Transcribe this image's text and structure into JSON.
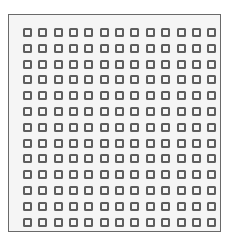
{
  "grid": {
    "rows": 13,
    "cols": 13,
    "origin_x": 14,
    "origin_y": 13,
    "pitch_x": 15.35,
    "pitch_y": 15.8,
    "cell_color": "#5e5e5e",
    "frame_border_color": "#6a6a6a",
    "frame_background": "#f5f5f5"
  }
}
